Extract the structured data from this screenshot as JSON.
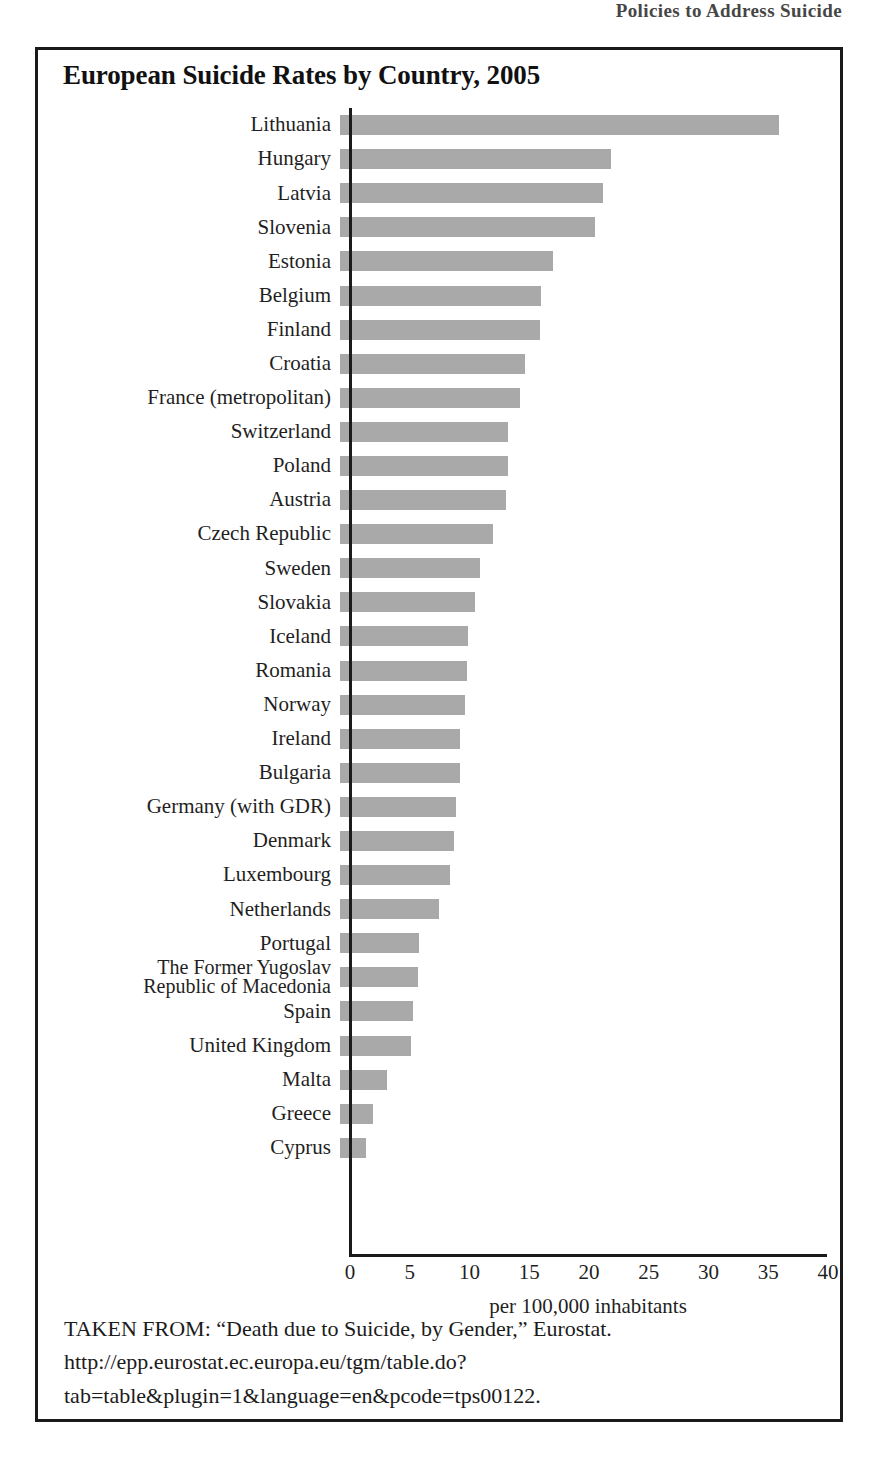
{
  "running_head": "Policies to Address Suicide",
  "figure": {
    "title": "European Suicide Rates by Country, 2005",
    "caption": "TAKEN FROM: “Death due to Suicide, by Gender,” Eurostat. http://epp.eurostat.ec.europa.eu/tgm/table.do?tab=table&plugin=1&language=en&pcode=tps00122."
  },
  "chart_data": {
    "type": "bar",
    "orientation": "horizontal",
    "title": "European Suicide Rates by Country, 2005",
    "xlabel": "per 100,000 inhabitants",
    "ylabel": "",
    "xlim": [
      0,
      40
    ],
    "xticks": [
      0,
      5,
      10,
      15,
      20,
      25,
      30,
      35,
      40
    ],
    "xtick_labels": [
      "0",
      "5",
      "10",
      "15",
      "20",
      "25",
      "30",
      "35",
      "40"
    ],
    "grid": false,
    "legend": null,
    "bar_color": "#a9a9a9",
    "categories": [
      "Lithuania",
      "Hungary",
      "Latvia",
      "Slovenia",
      "Estonia",
      "Belgium",
      "Finland",
      "Croatia",
      "France (metropolitan)",
      "Switzerland",
      "Poland",
      "Austria",
      "Czech Republic",
      "Sweden",
      "Slovakia",
      "Iceland",
      "Romania",
      "Norway",
      "Ireland",
      "Bulgaria",
      "Germany (with GDR)",
      "Denmark",
      "Luxembourg",
      "Netherlands",
      "Portugal",
      "The Former Yugoslav\nRepublic of Macedonia",
      "Spain",
      "United Kingdom",
      "Malta",
      "Greece",
      "Cyprus"
    ],
    "values": [
      36.7,
      22.7,
      22.0,
      21.3,
      17.8,
      16.8,
      16.7,
      15.5,
      15.1,
      14.1,
      14.1,
      13.9,
      12.8,
      11.7,
      11.3,
      10.7,
      10.6,
      10.5,
      10.0,
      10.0,
      9.7,
      9.5,
      9.2,
      8.3,
      6.6,
      6.5,
      6.1,
      5.9,
      3.9,
      2.8,
      2.2
    ]
  }
}
